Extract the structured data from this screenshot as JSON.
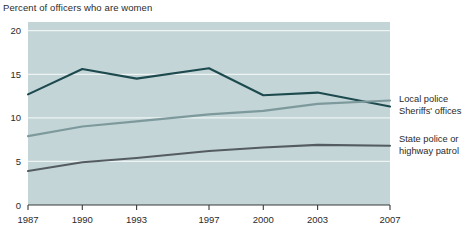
{
  "chart_data": {
    "type": "line",
    "title": "Percent of officers who are women",
    "xlabel": "",
    "ylabel": "",
    "x": [
      1987,
      1990,
      1993,
      1997,
      2000,
      2003,
      2007
    ],
    "xtick_labels": [
      "1987",
      "1990",
      "1993",
      "1997",
      "2000",
      "2003",
      "2007"
    ],
    "ytick_labels": [
      "0",
      "5",
      "10",
      "15",
      "20"
    ],
    "yticks": [
      0,
      5,
      10,
      15,
      20
    ],
    "ylim": [
      0,
      21
    ],
    "xlim": [
      1987,
      2007
    ],
    "grid": "horizontal",
    "legend_position": "right",
    "plot_background": "#c3d5d7",
    "series": [
      {
        "name": "Local police",
        "color": "#1d4a4e",
        "values": [
          12.7,
          15.6,
          14.5,
          15.7,
          12.6,
          12.9,
          11.3
        ]
      },
      {
        "name": "Sheriffs' offices",
        "color": "#7d999c",
        "values": [
          7.9,
          9.0,
          9.6,
          10.4,
          10.8,
          11.6,
          12.0
        ]
      },
      {
        "name": "State police or highway patrol",
        "color": "#545c61",
        "values": [
          3.9,
          4.9,
          5.4,
          6.2,
          6.6,
          6.9,
          6.8
        ]
      }
    ]
  },
  "legend": {
    "local_police": "Local police",
    "sheriffs_offices": "Sheriffs' offices",
    "state_police_line1": "State police or",
    "state_police_line2": "highway patrol"
  },
  "colors": {
    "local_police": "#1d4a4e",
    "sheriffs_offices": "#7d999c",
    "state_police": "#545c61",
    "plot_background": "#c3d5d7",
    "gridline": "#eef4f4",
    "axis": "#3a3a3a",
    "text": "#2b2b2b",
    "page_background": "#ffffff"
  }
}
